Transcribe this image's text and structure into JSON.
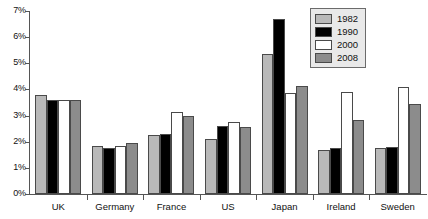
{
  "chart_data": {
    "type": "bar",
    "title": "",
    "subtitle": "",
    "xlabel": "",
    "ylabel": "",
    "categories": [
      "UK",
      "Germany",
      "France",
      "US",
      "Japan",
      "Ireland",
      "Sweden"
    ],
    "series": [
      {
        "name": "1982",
        "color": "#b9b9b9",
        "values": [
          3.8,
          1.85,
          2.25,
          2.1,
          5.35,
          1.7,
          1.75
        ]
      },
      {
        "name": "1990",
        "color": "#000000",
        "values": [
          3.6,
          1.75,
          2.3,
          2.6,
          6.7,
          1.75,
          1.8
        ]
      },
      {
        "name": "2000",
        "color": "#ffffff",
        "values": [
          3.6,
          1.85,
          3.15,
          2.75,
          3.85,
          3.9,
          4.1
        ]
      },
      {
        "name": "2008",
        "color": "#8c8c8c",
        "values": [
          3.6,
          1.95,
          3.0,
          2.55,
          4.15,
          2.85,
          3.45
        ]
      }
    ],
    "ylim": [
      0,
      7
    ],
    "y_tick_values": [
      0,
      1,
      2,
      3,
      4,
      5,
      6,
      7
    ],
    "y_tick_labels": [
      "0%",
      "1%",
      "2%",
      "3%",
      "4%",
      "5%",
      "6%",
      "7%"
    ],
    "grid": false,
    "legend_position": "top-right",
    "axis_color": "#555555",
    "bar_border_color": "#4a4a4a",
    "legend_background": "#e9e9e9",
    "legend_border": "#6b6b6b",
    "text_color": "#111111"
  }
}
